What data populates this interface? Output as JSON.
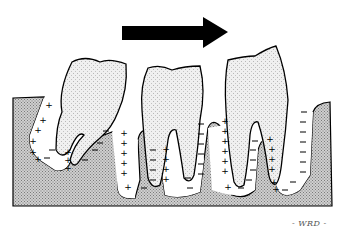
{
  "figure": {
    "arrow": {
      "direction": "right",
      "color": "#000000"
    },
    "legend_signs": {
      "deposition": "+",
      "resorption": "−"
    },
    "signature": "- WRD -",
    "colors": {
      "bone": "#b8b8b8",
      "tooth": "#e6e6e6",
      "outline": "#000000",
      "background": "#ffffff"
    }
  }
}
